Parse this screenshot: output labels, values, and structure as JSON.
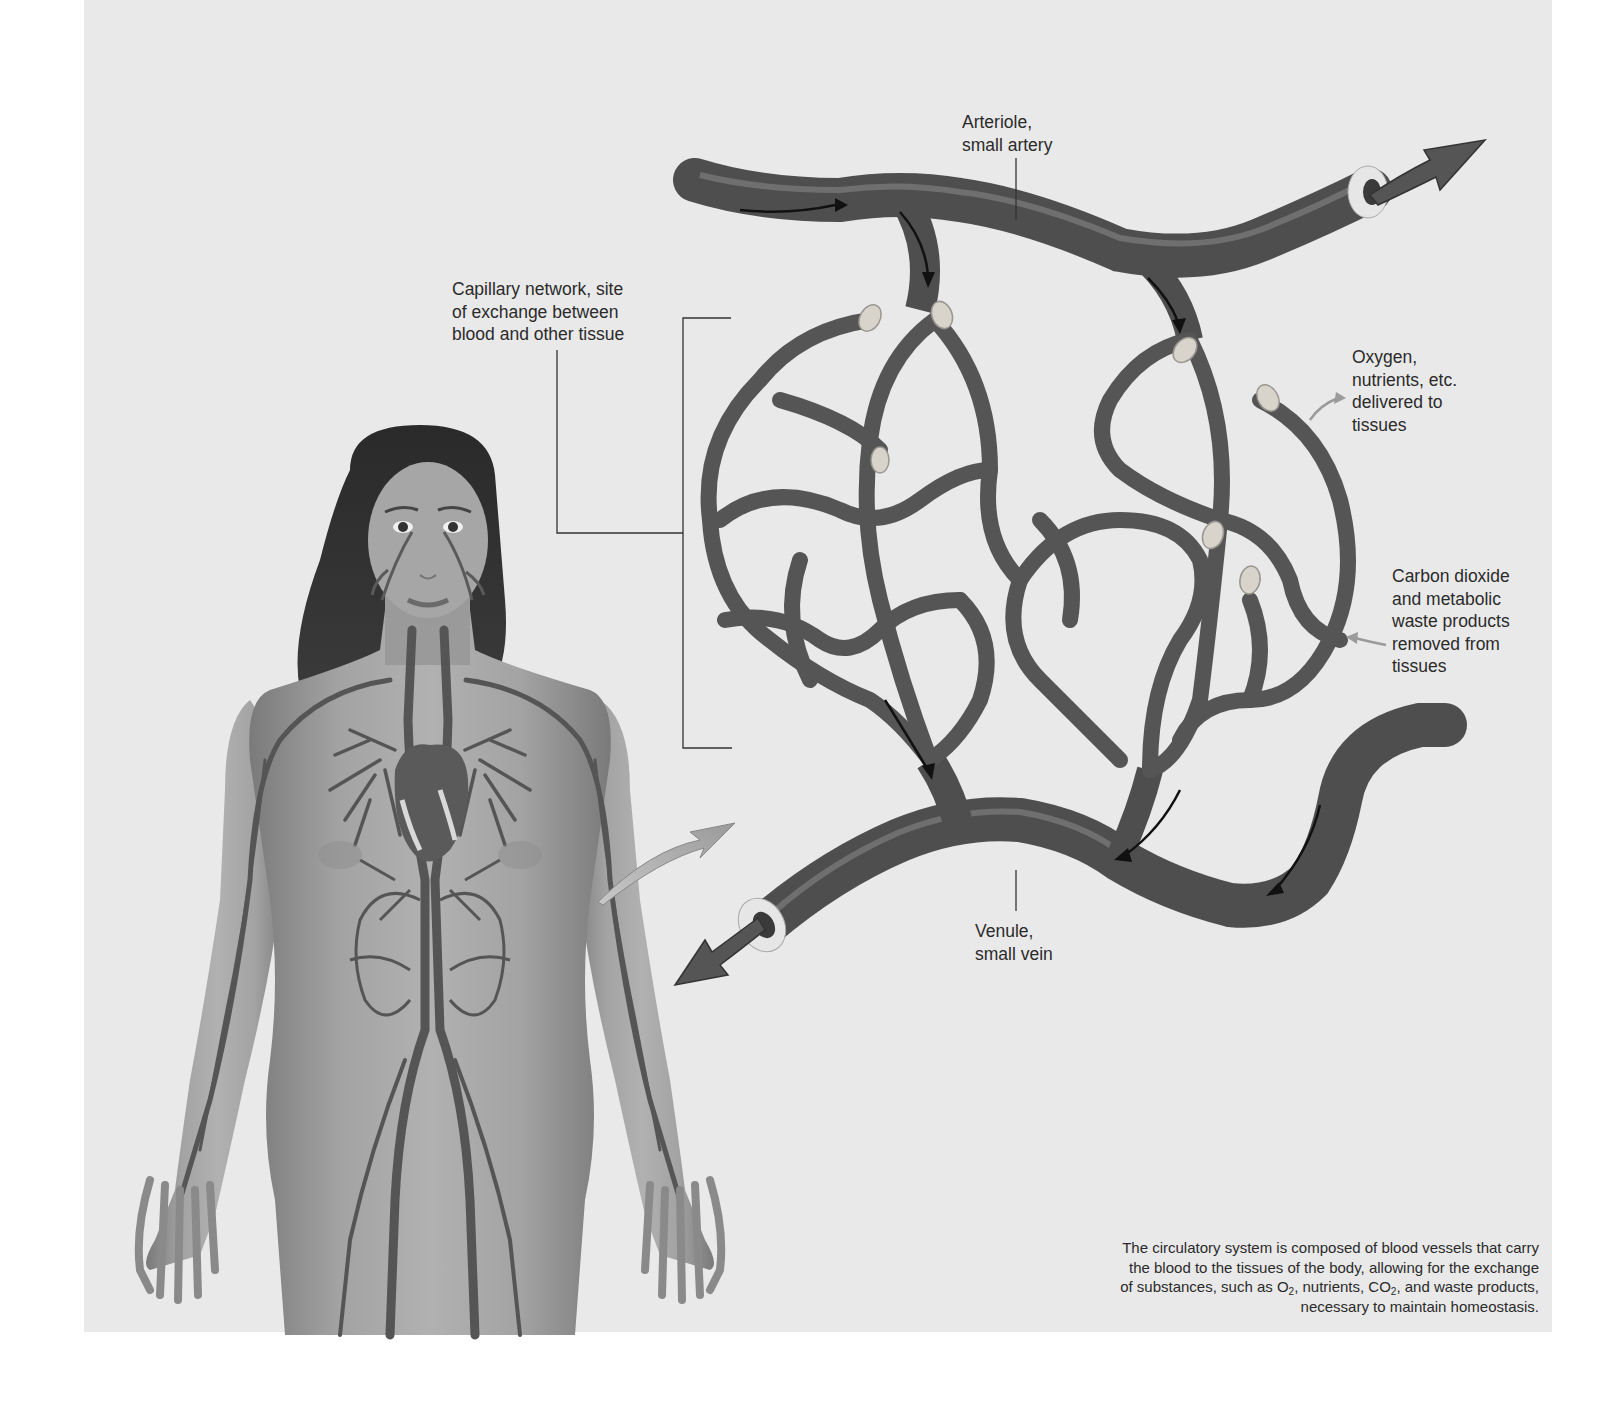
{
  "figure": {
    "colors": {
      "background_panel": "#e9e9e9",
      "page": "#ffffff",
      "vessel": "#555555",
      "vessel_highlight": "#8a8a8a",
      "sphincter": "#d8d4cc",
      "text": "#2b2b2b",
      "flow_arrow": "#1a1a1a",
      "pointer_arrow": "#9a9a9a"
    }
  },
  "labels": {
    "arteriole": {
      "line1": "Arteriole,",
      "line2": "small artery"
    },
    "capillary_network": {
      "line1": "Capillary network, site",
      "line2": "of exchange between",
      "line3": "blood and other tissue"
    },
    "oxygen_delivery": {
      "line1": "Oxygen,",
      "line2": "nutrients, etc.",
      "line3": "delivered to",
      "line4": "tissues"
    },
    "co2_removal": {
      "line1": "Carbon dioxide",
      "line2": "and metabolic",
      "line3": "waste products",
      "line4": "removed from",
      "line5": "tissues"
    },
    "venule": {
      "line1": "Venule,",
      "line2": "small vein"
    }
  },
  "caption": {
    "line1": "The circulatory system is composed of blood vessels that carry",
    "line2": "the blood to the tissues of the body, allowing for the exchange",
    "line3_a": "of substances, such as O",
    "line3_sub1": "2",
    "line3_b": ", nutrients, CO",
    "line3_sub2": "2",
    "line3_c": ", and waste products,",
    "line4": "necessary to maintain homeostasis."
  },
  "icons": {
    "body_figure": "human-body-circulatory-illustration",
    "zoom_arrow": "magnify-pointer-arrow",
    "arteriole_outflow": "outflow-arrow",
    "venule_outflow": "outflow-arrow",
    "flow_arrows": "blood-flow-direction-arrows",
    "sphincters": "precapillary-sphincter-rings"
  }
}
